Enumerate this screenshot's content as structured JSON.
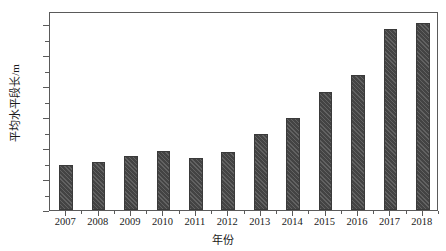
{
  "chart_data": {
    "type": "bar",
    "title": "",
    "xlabel": "年份",
    "ylabel": "平均水平段长/m",
    "categories": [
      "2007",
      "2008",
      "2009",
      "2010",
      "2011",
      "2012",
      "2013",
      "2014",
      "2015",
      "2016",
      "2017",
      "2018"
    ],
    "values": [
      725,
      775,
      870,
      955,
      840,
      935,
      1230,
      1490,
      1900,
      2180,
      2920,
      3010
    ],
    "series": [
      {
        "name": "平均水平段长",
        "values": [
          725,
          775,
          870,
          955,
          840,
          935,
          1230,
          1490,
          1900,
          2180,
          2920,
          3010
        ]
      }
    ],
    "ylim": [
      0,
      3210
    ],
    "xlim_categories": 12,
    "y_major_ticks": [
      0,
      500,
      1000,
      1500,
      2000,
      2500,
      3000
    ],
    "y_tick_labels": [
      "0",
      "500",
      "1000",
      "1500",
      "2000",
      "2500",
      "3000"
    ],
    "y_minor_ticks": [
      250,
      750,
      1250,
      1750,
      2250,
      2750
    ],
    "grid": false,
    "legend": null,
    "legend_position": "none",
    "bar_color": "#4b4b4b",
    "bar_edge_color": "#3a3a3a",
    "bar_hatch": "diagonal",
    "axis_color": "#5a5a5a",
    "background_color": "#ffffff",
    "units": "m"
  }
}
